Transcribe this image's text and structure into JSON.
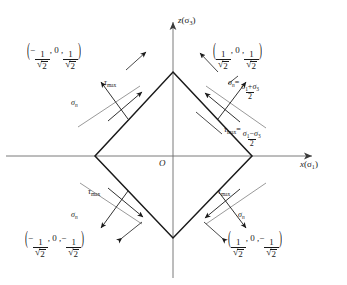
{
  "figure": {
    "colors": {
      "line": "#1a1a1a",
      "axis": "#555555",
      "plane_trace": "#8c8c8c",
      "background": "#ffffff"
    },
    "axes": {
      "x_label_var": "x",
      "x_label_paren": "(σ",
      "x_label_sub": "1",
      "x_label_close": ")",
      "z_label_var": "z",
      "z_label_paren": "(σ",
      "z_label_sub": "3",
      "z_label_close": ")",
      "origin_label": "O"
    },
    "vertices": [
      {
        "name": "top",
        "x": 0,
        "z": 1,
        "label": "(1/√2, 0, 1/√2)"
      },
      {
        "name": "right",
        "x": 1,
        "z": 0,
        "label": ""
      },
      {
        "name": "bottom",
        "x": 0,
        "z": -1,
        "label": ""
      },
      {
        "name": "left",
        "x": -1,
        "z": 0,
        "label": ""
      }
    ],
    "coord_labels": [
      {
        "id": "top-left",
        "position": "upper-left",
        "sign_x": "−",
        "x_num": "1",
        "x_den_radical": "√",
        "x_den": "2",
        "mid": ", 0 ,",
        "sign_z": "",
        "z_num": "1",
        "z_den_radical": "√",
        "z_den": "2",
        "text": "(−1/√2 , 0 , 1/√2)"
      },
      {
        "id": "top-right",
        "position": "upper-right",
        "sign_x": "",
        "x_num": "1",
        "x_den_radical": "√",
        "x_den": "2",
        "mid": ", 0 ,",
        "sign_z": "",
        "z_num": "1",
        "z_den_radical": "√",
        "z_den": "2",
        "text": "(1/√2 , 0 , 1/√2)"
      },
      {
        "id": "bottom-left",
        "position": "lower-left",
        "sign_x": "−",
        "x_num": "1",
        "x_den_radical": "√",
        "x_den": "2",
        "mid": ", 0 ,",
        "sign_z": "−",
        "z_num": "1",
        "z_den_radical": "√",
        "z_den": "2",
        "text": "(−1/√2 , 0 , −1/√2)"
      },
      {
        "id": "bottom-right",
        "position": "lower-right",
        "sign_x": "",
        "x_num": "1",
        "x_den_radical": "√",
        "x_den": "2",
        "mid": ", 0 ,",
        "sign_z": "−",
        "z_num": "1",
        "z_den_radical": "√",
        "z_den": "2",
        "text": "(1/√2 , 0 , −1/√2)"
      }
    ],
    "stress_labels": {
      "tau_symbol": "τ",
      "tau_sub": "max",
      "sigma_symbol": "σ",
      "sigma_sub": "n",
      "quadrants": [
        {
          "id": "upper-left",
          "tau": "τmax",
          "sigma": "σn"
        },
        {
          "id": "upper-right",
          "tau": "τmax",
          "sigma": "σn"
        },
        {
          "id": "lower-left",
          "tau": "τmax",
          "sigma": "σn"
        },
        {
          "id": "lower-right",
          "tau": "τmax",
          "sigma": "σn"
        }
      ]
    },
    "formulas": {
      "sigma_n": {
        "lhs_symbol": "σ",
        "lhs_sub": "n",
        "equals": "=",
        "num_a": "σ",
        "num_a_sub": "1",
        "plus": "+",
        "num_b": "σ",
        "num_b_sub": "3",
        "den": "2",
        "text": "σn = (σ1 + σ3)/2"
      },
      "tau_max": {
        "lhs_symbol": "τ",
        "lhs_sub": "max",
        "equals": "=",
        "num_a": "σ",
        "num_a_sub": "1",
        "minus": "−",
        "num_b": "σ",
        "num_b_sub": "3",
        "den": "2",
        "text": "τmax = (σ1 − σ3)/2"
      }
    }
  }
}
